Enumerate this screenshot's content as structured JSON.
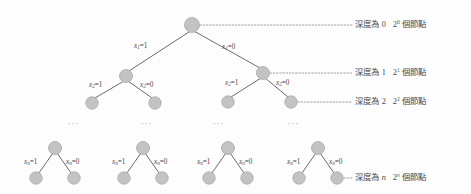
{
  "figure": {
    "title_alt": "Binary decision tree depth diagram",
    "node_color": "#c3c3c3",
    "node_stroke": "#a8a8a8",
    "edge_color": "#6b6b6b",
    "leader_color": "#9b9b9b",
    "text_color": "#4a4a4a"
  },
  "tree": {
    "root": {
      "id": "root",
      "cx": 192,
      "cy": 25,
      "r": 7.5
    },
    "depth1": [
      {
        "id": "d1-left",
        "cx": 126,
        "cy": 76,
        "r": 6.5
      },
      {
        "id": "d1-right",
        "cx": 263,
        "cy": 73,
        "r": 6.5
      }
    ],
    "depth2": [
      {
        "id": "d2-a",
        "cx": 92,
        "cy": 103,
        "r": 6.2
      },
      {
        "id": "d2-b",
        "cx": 155,
        "cy": 103,
        "r": 6.2
      },
      {
        "id": "d2-c",
        "cx": 228,
        "cy": 102,
        "r": 6.2
      },
      {
        "id": "d2-d",
        "cx": 291,
        "cy": 102,
        "r": 6.2
      }
    ],
    "bottom_subtrees": [
      {
        "id": "bt-1",
        "apex_cx": 55,
        "apex_cy": 148,
        "left_cx": 36,
        "right_cx": 74,
        "leaf_cy": 178
      },
      {
        "id": "bt-2",
        "apex_cx": 143,
        "apex_cy": 148,
        "left_cx": 124,
        "right_cx": 162,
        "leaf_cy": 178
      },
      {
        "id": "bt-3",
        "apex_cx": 228,
        "apex_cy": 148,
        "left_cx": 209,
        "right_cx": 247,
        "leaf_cy": 178
      },
      {
        "id": "bt-4",
        "apex_cx": 318,
        "apex_cy": 148,
        "left_cx": 299,
        "right_cx": 337,
        "leaf_cy": 178
      }
    ]
  },
  "edge_labels": {
    "level1": [
      {
        "var": "x",
        "sub": "1",
        "eq": "=1",
        "x": 134,
        "y": 43
      },
      {
        "var": "x",
        "sub": "1",
        "eq": "=0",
        "x": 222,
        "y": 44
      }
    ],
    "level2": [
      {
        "var": "x",
        "sub": "2",
        "eq": "=1",
        "x": 89,
        "y": 82
      },
      {
        "var": "x",
        "sub": "2",
        "eq": "=0",
        "x": 140,
        "y": 82
      },
      {
        "var": "x",
        "sub": "2",
        "eq": "=1",
        "x": 225,
        "y": 80
      },
      {
        "var": "x",
        "sub": "2",
        "eq": "=0",
        "x": 276,
        "y": 80
      }
    ],
    "bottom": [
      {
        "var": "x",
        "sub": "n",
        "eq": "=1",
        "x": 24,
        "y": 159
      },
      {
        "var": "x",
        "sub": "n",
        "eq": "=0",
        "x": 66,
        "y": 159
      },
      {
        "var": "x",
        "sub": "n",
        "eq": "=1",
        "x": 112,
        "y": 159
      },
      {
        "var": "x",
        "sub": "n",
        "eq": "=0",
        "x": 154,
        "y": 159
      },
      {
        "var": "x",
        "sub": "n",
        "eq": "=1",
        "x": 197,
        "y": 159
      },
      {
        "var": "x",
        "sub": "n",
        "eq": "=0",
        "x": 239,
        "y": 159
      },
      {
        "var": "x",
        "sub": "n",
        "eq": "=1",
        "x": 287,
        "y": 159
      },
      {
        "var": "x",
        "sub": "n",
        "eq": "=0",
        "x": 329,
        "y": 159
      }
    ]
  },
  "depth_labels": [
    {
      "id": "depth-0",
      "prefix": "深度為",
      "depth": "0",
      "depth_italic": false,
      "base": "2",
      "exp": "0",
      "exp_italic": false,
      "suffix": "個節點",
      "x": 355,
      "y": 20,
      "leader_from_x": 200,
      "leader_to_x": 352,
      "leader_y": 25
    },
    {
      "id": "depth-1",
      "prefix": "深度為",
      "depth": "1",
      "depth_italic": false,
      "base": "2",
      "exp": "1",
      "exp_italic": false,
      "suffix": "個節點",
      "x": 355,
      "y": 68,
      "leader_from_x": 270,
      "leader_to_x": 352,
      "leader_y": 73
    },
    {
      "id": "depth-2",
      "prefix": "深度為",
      "depth": "2",
      "depth_italic": false,
      "base": "2",
      "exp": "2",
      "exp_italic": false,
      "suffix": "個節點",
      "x": 355,
      "y": 97,
      "leader_from_x": 298,
      "leader_to_x": 352,
      "leader_y": 102
    },
    {
      "id": "depth-n",
      "prefix": "深度為",
      "depth": "n",
      "depth_italic": true,
      "base": "2",
      "exp": "n",
      "exp_italic": true,
      "suffix": "個節點",
      "x": 355,
      "y": 173,
      "leader_from_x": 344,
      "leader_to_x": 352,
      "leader_y": 178
    }
  ],
  "ellipses": [
    {
      "id": "ellipsis-1",
      "text": "···",
      "x": 68,
      "y": 120
    },
    {
      "id": "ellipsis-2",
      "text": "···",
      "x": 141,
      "y": 120
    },
    {
      "id": "ellipsis-3",
      "text": "···",
      "x": 213,
      "y": 120
    },
    {
      "id": "ellipsis-4",
      "text": "···",
      "x": 288,
      "y": 120
    }
  ]
}
